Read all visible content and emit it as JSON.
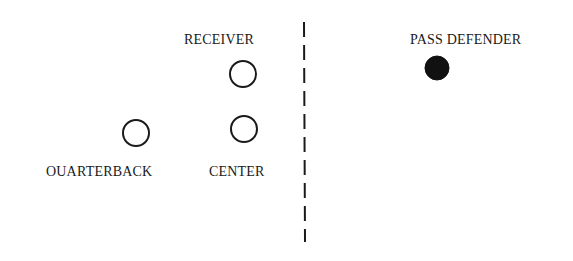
{
  "diagram": {
    "labels": {
      "receiver": "RECEIVER",
      "quarterback": "OUARTERBACK",
      "center": "CENTER",
      "pass_defender": "PASS DEFENDER"
    },
    "players": [
      {
        "id": "receiver",
        "shape": "open-circle",
        "cx": 243,
        "cy": 74,
        "r": 13
      },
      {
        "id": "center",
        "shape": "open-circle",
        "cx": 244,
        "cy": 129,
        "r": 13
      },
      {
        "id": "quarterback",
        "shape": "open-circle",
        "cx": 136,
        "cy": 133,
        "r": 13
      },
      {
        "id": "pass_defender",
        "shape": "filled-circle",
        "cx": 437,
        "cy": 68,
        "r": 12
      }
    ],
    "line_of_scrimmage": {
      "style": "dashed",
      "x": 304,
      "y_start": 22,
      "y_end": 242
    },
    "colors": {
      "ink": "#1a1a1a",
      "background": "#ffffff"
    }
  }
}
